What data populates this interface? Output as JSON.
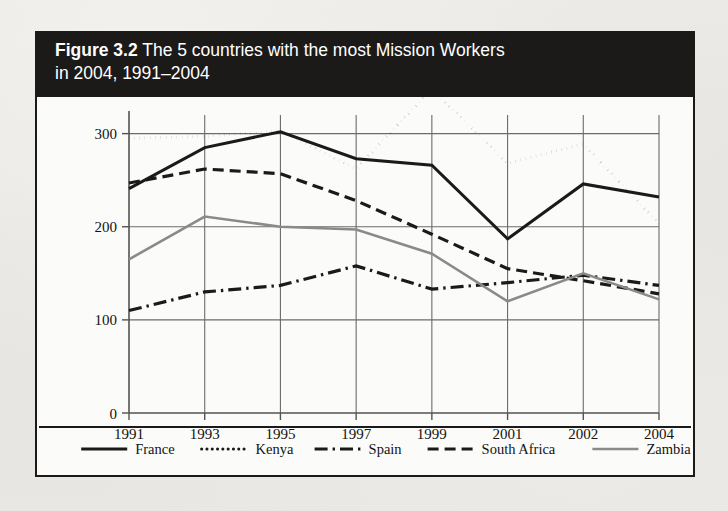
{
  "figure": {
    "number_label": "Figure 3.2",
    "caption": " The 5 countries with the most Mission Workers in 2004, 1991–2004",
    "title_line1_prefix": "Figure 3.2",
    "title_line1_rest": " The 5 countries with the most Mission Workers",
    "title_line2": "in 2004, 1991–2004"
  },
  "page": {
    "bleed_text": "MISSION WORKERS",
    "background_color": "#e8e7e3",
    "banner_color": "#1b1a19",
    "panel_color": "#fbfbf9",
    "ink_color": "#141312"
  },
  "chart_data": {
    "type": "line",
    "title": "Figure 3.2 The 5 countries with the most Mission Workers in 2004, 1991–2004",
    "xlabel": "",
    "ylabel": "",
    "categories": [
      "1991",
      "1993",
      "1995",
      "1997",
      "1999",
      "2001",
      "2002",
      "2004"
    ],
    "yticks": [
      0,
      100,
      200,
      300
    ],
    "ylim": [
      0,
      320
    ],
    "grid": true,
    "legend_position": "bottom",
    "series": [
      {
        "name": "France",
        "style": "solid",
        "color": "#1b1a19",
        "values": [
          241,
          285,
          302,
          273,
          266,
          187,
          246,
          232
        ]
      },
      {
        "name": "Kenya",
        "style": "dotted",
        "color": "#1b1a19",
        "values": [
          295,
          297,
          303,
          262,
          348,
          268,
          289,
          203
        ]
      },
      {
        "name": "Spain",
        "style": "dash-dot",
        "color": "#1b1a19",
        "values": [
          110,
          130,
          137,
          158,
          133,
          140,
          148,
          137
        ]
      },
      {
        "name": "South Africa",
        "style": "dashed",
        "color": "#1b1a19",
        "values": [
          247,
          262,
          257,
          228,
          192,
          155,
          142,
          128
        ]
      },
      {
        "name": "Zambia",
        "style": "solid",
        "color": "#8a8a88",
        "values": [
          165,
          211,
          200,
          197,
          171,
          120,
          150,
          122
        ]
      }
    ]
  },
  "legend": {
    "entries": [
      {
        "label": "France"
      },
      {
        "label": "Kenya"
      },
      {
        "label": "Spain"
      },
      {
        "label": "South Africa"
      },
      {
        "label": "Zambia"
      }
    ]
  }
}
